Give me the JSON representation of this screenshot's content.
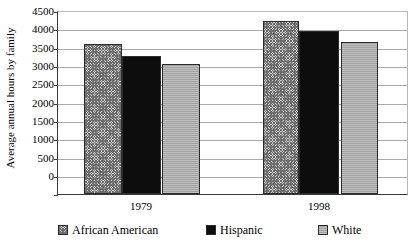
{
  "chart_data": {
    "type": "bar",
    "title": "",
    "xlabel": "",
    "ylabel": "Average annual hours by family",
    "categories": [
      "1979",
      "1998"
    ],
    "series": [
      {
        "name": "African American",
        "values": [
          3700,
          4250
        ],
        "swatch": "checkered-gray"
      },
      {
        "name": "Hispanic",
        "values": [
          3400,
          4000
        ],
        "swatch": "solid-black"
      },
      {
        "name": "White",
        "values": [
          3200,
          3750
        ],
        "swatch": "light-gray"
      }
    ],
    "ylim": [
      0,
      4500
    ],
    "ytick_step": 500,
    "yticks": [
      "4500",
      "4000",
      "3500",
      "3000",
      "2500",
      "2000",
      "1500",
      "1000",
      "500",
      "0"
    ],
    "grid": true,
    "legend_position": "bottom"
  },
  "colors": {
    "african_american": "#c9c9c9",
    "hispanic": "#0d0d0d",
    "white": "#b4b4b4",
    "gridline": "#a8a8a8",
    "axis": "#3a3a3a",
    "background": "#ffffff"
  }
}
